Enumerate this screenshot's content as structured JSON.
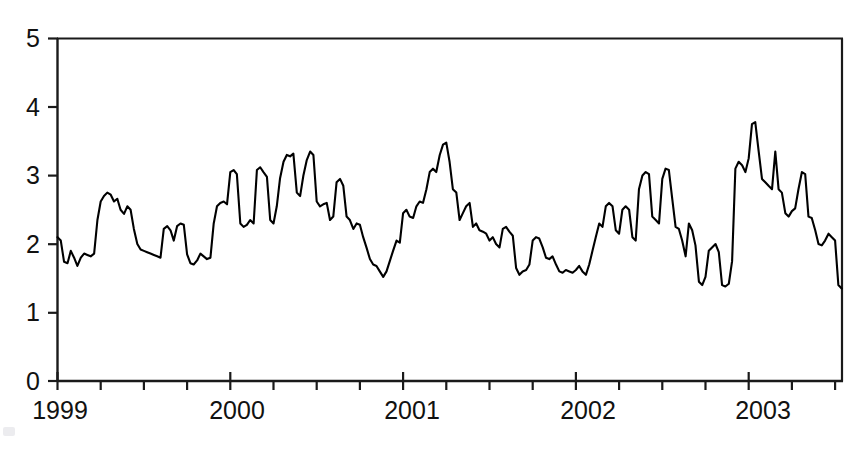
{
  "chart_data": {
    "type": "line",
    "title": "",
    "xlabel": "",
    "ylabel": "",
    "xlim": [
      1999.0,
      2003.54
    ],
    "ylim": [
      0,
      5
    ],
    "yticks": [
      0,
      1,
      2,
      3,
      4,
      5
    ],
    "ytick_labels": [
      "0",
      "1",
      "2",
      "3",
      "4",
      "5"
    ],
    "xticks": [
      1999,
      2000,
      2001,
      2002,
      2003
    ],
    "xtick_labels": [
      "1999",
      "2000",
      "2001",
      "2002",
      "2003"
    ],
    "x_minor_tick_interval": 0.25,
    "grid": false,
    "legend": null,
    "line_color": "#000000",
    "line_width": 2.1,
    "axis_color": "#1a1a1a",
    "background_color": "#ffffff",
    "series": [
      {
        "name": "series-1",
        "x": [
          1999.0,
          1999.019,
          1999.038,
          1999.058,
          1999.077,
          1999.096,
          1999.115,
          1999.135,
          1999.154,
          1999.173,
          1999.192,
          1999.212,
          1999.231,
          1999.25,
          1999.269,
          1999.288,
          1999.308,
          1999.327,
          1999.346,
          1999.365,
          1999.385,
          1999.404,
          1999.423,
          1999.442,
          1999.462,
          1999.481,
          1999.5,
          1999.519,
          1999.538,
          1999.558,
          1999.577,
          1999.596,
          1999.615,
          1999.635,
          1999.654,
          1999.673,
          1999.692,
          1999.712,
          1999.731,
          1999.75,
          1999.769,
          1999.788,
          1999.808,
          1999.827,
          1999.846,
          1999.865,
          1999.885,
          1999.904,
          1999.923,
          1999.942,
          1999.962,
          1999.981,
          2000.0,
          2000.019,
          2000.038,
          2000.058,
          2000.077,
          2000.096,
          2000.115,
          2000.135,
          2000.154,
          2000.173,
          2000.192,
          2000.212,
          2000.231,
          2000.25,
          2000.269,
          2000.288,
          2000.308,
          2000.327,
          2000.346,
          2000.365,
          2000.385,
          2000.404,
          2000.423,
          2000.442,
          2000.462,
          2000.481,
          2000.5,
          2000.519,
          2000.538,
          2000.558,
          2000.577,
          2000.596,
          2000.615,
          2000.635,
          2000.654,
          2000.673,
          2000.692,
          2000.712,
          2000.731,
          2000.75,
          2000.769,
          2000.788,
          2000.808,
          2000.827,
          2000.846,
          2000.865,
          2000.885,
          2000.904,
          2000.923,
          2000.942,
          2000.962,
          2000.981,
          2001.0,
          2001.019,
          2001.038,
          2001.058,
          2001.077,
          2001.096,
          2001.115,
          2001.135,
          2001.154,
          2001.173,
          2001.192,
          2001.212,
          2001.231,
          2001.25,
          2001.269,
          2001.288,
          2001.308,
          2001.327,
          2001.346,
          2001.365,
          2001.385,
          2001.404,
          2001.423,
          2001.442,
          2001.462,
          2001.481,
          2001.5,
          2001.519,
          2001.538,
          2001.558,
          2001.577,
          2001.596,
          2001.615,
          2001.635,
          2001.654,
          2001.673,
          2001.692,
          2001.712,
          2001.731,
          2001.75,
          2001.769,
          2001.788,
          2001.808,
          2001.827,
          2001.846,
          2001.865,
          2001.885,
          2001.904,
          2001.923,
          2001.942,
          2001.962,
          2001.981,
          2002.0,
          2002.019,
          2002.038,
          2002.058,
          2002.077,
          2002.096,
          2002.115,
          2002.135,
          2002.154,
          2002.173,
          2002.192,
          2002.212,
          2002.231,
          2002.25,
          2002.269,
          2002.288,
          2002.308,
          2002.327,
          2002.346,
          2002.365,
          2002.385,
          2002.404,
          2002.423,
          2002.442,
          2002.462,
          2002.481,
          2002.5,
          2002.519,
          2002.538,
          2002.558,
          2002.577,
          2002.596,
          2002.615,
          2002.635,
          2002.654,
          2002.673,
          2002.692,
          2002.712,
          2002.731,
          2002.75,
          2002.769,
          2002.788,
          2002.808,
          2002.827,
          2002.846,
          2002.865,
          2002.885,
          2002.904,
          2002.923,
          2002.942,
          2002.962,
          2002.981,
          2003.0,
          2003.019,
          2003.038,
          2003.058,
          2003.077,
          2003.096,
          2003.115,
          2003.135,
          2003.154,
          2003.173,
          2003.192,
          2003.212,
          2003.231,
          2003.25,
          2003.269,
          2003.288,
          2003.308,
          2003.327,
          2003.346,
          2003.365,
          2003.385,
          2003.404,
          2003.423,
          2003.442,
          2003.462,
          2003.481,
          2003.5,
          2003.519,
          2003.538
        ],
        "y": [
          2.1,
          2.05,
          1.74,
          1.72,
          1.9,
          1.8,
          1.68,
          1.8,
          1.86,
          1.84,
          1.82,
          1.86,
          2.35,
          2.62,
          2.7,
          2.75,
          2.72,
          2.62,
          2.66,
          2.5,
          2.44,
          2.55,
          2.5,
          2.22,
          2.0,
          1.92,
          1.9,
          1.88,
          1.86,
          1.84,
          1.82,
          1.8,
          2.22,
          2.26,
          2.2,
          2.05,
          2.26,
          2.3,
          2.28,
          1.85,
          1.72,
          1.7,
          1.76,
          1.86,
          1.82,
          1.78,
          1.8,
          2.3,
          2.55,
          2.6,
          2.62,
          2.58,
          3.05,
          3.08,
          3.02,
          2.3,
          2.25,
          2.28,
          2.35,
          2.3,
          3.08,
          3.12,
          3.05,
          2.98,
          2.35,
          2.3,
          2.55,
          2.96,
          3.2,
          3.3,
          3.28,
          3.32,
          2.75,
          2.7,
          3.0,
          3.22,
          3.35,
          3.3,
          2.62,
          2.55,
          2.58,
          2.6,
          2.35,
          2.4,
          2.9,
          2.95,
          2.85,
          2.4,
          2.35,
          2.22,
          2.3,
          2.28,
          2.1,
          1.95,
          1.78,
          1.7,
          1.68,
          1.6,
          1.52,
          1.6,
          1.75,
          1.9,
          2.05,
          2.02,
          2.45,
          2.5,
          2.4,
          2.38,
          2.55,
          2.62,
          2.6,
          2.8,
          3.05,
          3.1,
          3.05,
          3.3,
          3.45,
          3.48,
          3.2,
          2.8,
          2.75,
          2.35,
          2.45,
          2.55,
          2.6,
          2.25,
          2.3,
          2.2,
          2.18,
          2.15,
          2.05,
          2.1,
          2.0,
          1.95,
          2.22,
          2.25,
          2.18,
          2.12,
          1.65,
          1.55,
          1.6,
          1.62,
          1.7,
          2.05,
          2.1,
          2.08,
          1.95,
          1.8,
          1.78,
          1.82,
          1.7,
          1.6,
          1.58,
          1.62,
          1.6,
          1.58,
          1.62,
          1.68,
          1.6,
          1.55,
          1.7,
          1.9,
          2.1,
          2.3,
          2.25,
          2.55,
          2.6,
          2.55,
          2.2,
          2.15,
          2.5,
          2.55,
          2.5,
          2.1,
          2.05,
          2.8,
          3.0,
          3.05,
          3.02,
          2.4,
          2.35,
          2.3,
          2.95,
          3.1,
          3.08,
          2.65,
          2.25,
          2.22,
          2.05,
          1.82,
          2.3,
          2.2,
          1.98,
          1.45,
          1.4,
          1.52,
          1.9,
          1.95,
          2.0,
          1.88,
          1.4,
          1.38,
          1.42,
          1.75,
          3.1,
          3.2,
          3.15,
          3.05,
          3.25,
          3.75,
          3.78,
          3.35,
          2.95,
          2.9,
          2.85,
          2.8,
          3.35,
          2.8,
          2.75,
          2.45,
          2.4,
          2.48,
          2.52,
          2.8,
          3.05,
          3.02,
          2.4,
          2.38,
          2.2,
          2.0,
          1.98,
          2.05,
          2.15,
          2.1,
          2.05,
          1.4,
          1.35
        ]
      }
    ],
    "notes": {
      "peak_max_value": 3.85,
      "peak_max_year": 2001.78,
      "trough_min_value": 1.0,
      "trough_min_year": 2002.72,
      "start_value": 2.1,
      "end_value": 2.85
    }
  },
  "axes": {
    "y_tick_labels": [
      "5",
      "4",
      "3",
      "2",
      "1",
      "0"
    ],
    "x_tick_labels": [
      "1999",
      "2000",
      "2001",
      "2002",
      "2003"
    ]
  }
}
